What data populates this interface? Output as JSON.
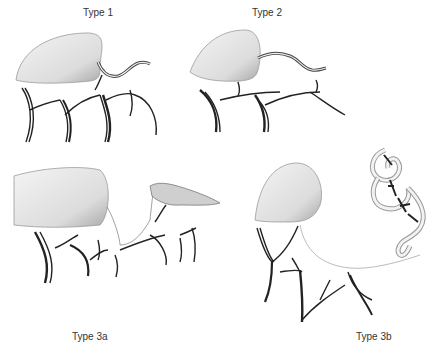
{
  "figure": {
    "panels": [
      {
        "id": "type-1",
        "label": "Type 1"
      },
      {
        "id": "type-2",
        "label": "Type 2"
      },
      {
        "id": "type-3a",
        "label": "Type 3a"
      },
      {
        "id": "type-3b",
        "label": "Type 3b"
      }
    ],
    "colors": {
      "background": "#ffffff",
      "ink": "#222222",
      "shading": "#b8b8b8",
      "label": "#333333"
    }
  }
}
